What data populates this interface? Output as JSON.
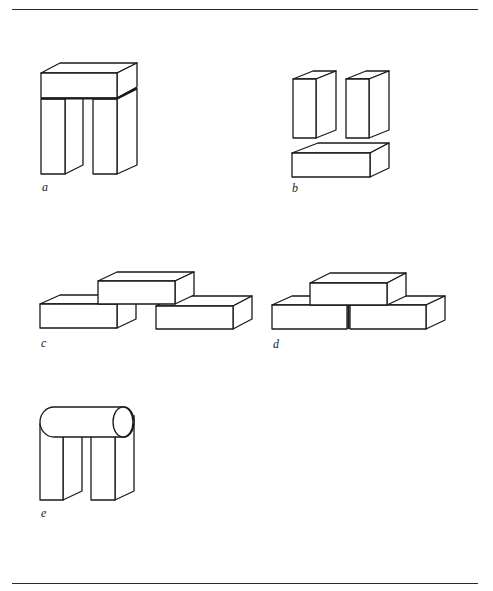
{
  "figure": {
    "panels": [
      {
        "id": "a",
        "label": "a",
        "description": "Lintel block resting across two upright pillars (arch)"
      },
      {
        "id": "b",
        "label": "b",
        "description": "Two upright pillars with a horizontal block lying separately below"
      },
      {
        "id": "c",
        "label": "c",
        "description": "Top block bridging two separated lower blocks"
      },
      {
        "id": "d",
        "label": "d",
        "description": "Top block resting on two touching lower blocks"
      },
      {
        "id": "e",
        "label": "e",
        "description": "Cylinder resting across two upright pillars"
      }
    ]
  },
  "colors": {
    "stroke": "#1a1a1a",
    "background": "#ffffff",
    "rule": "#2a2a2a"
  }
}
